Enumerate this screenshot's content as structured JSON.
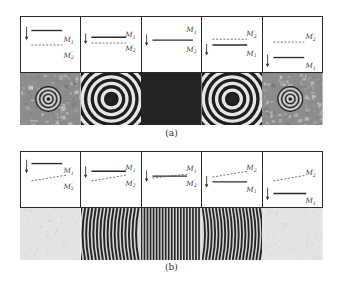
{
  "figure": {
    "panels": [
      {
        "id": "a",
        "caption": "(a)",
        "columns": [
          {
            "mirror_top": "M1",
            "mirror_bottom": "M2'",
            "m1_position": "above",
            "tilt": "none",
            "pattern": "small-concentric-rings-noisy"
          },
          {
            "mirror_top": "M1",
            "mirror_bottom": "M2'",
            "m1_position": "above",
            "tilt": "none",
            "pattern": "large-concentric-rings"
          },
          {
            "mirror_top": "M1",
            "mirror_bottom": "M2'",
            "m1_position": "coincident",
            "tilt": "none",
            "pattern": "uniform-dark"
          },
          {
            "mirror_top": "M2'",
            "mirror_bottom": "M1",
            "m1_position": "below",
            "tilt": "none",
            "pattern": "large-concentric-rings"
          },
          {
            "mirror_top": "M2'",
            "mirror_bottom": "M1",
            "m1_position": "below",
            "tilt": "none",
            "pattern": "small-concentric-rings-noisy"
          }
        ]
      },
      {
        "id": "b",
        "caption": "(b)",
        "columns": [
          {
            "mirror_top": "M1",
            "mirror_bottom": "M2'",
            "m1_position": "above",
            "tilt": "M2' tilted",
            "pattern": "uniform-light"
          },
          {
            "mirror_top": "M1",
            "mirror_bottom": "M2'",
            "m1_position": "above",
            "tilt": "M2' tilted",
            "pattern": "curved-fringes"
          },
          {
            "mirror_top": "M1",
            "mirror_bottom": "M2'",
            "m1_position": "crossing",
            "tilt": "M2' tilted",
            "pattern": "straight-fringes"
          },
          {
            "mirror_top": "M2'",
            "mirror_bottom": "M1",
            "m1_position": "below",
            "tilt": "M2' tilted",
            "pattern": "curved-fringes"
          },
          {
            "mirror_top": "M2'",
            "mirror_bottom": "M1",
            "m1_position": "below",
            "tilt": "M2' tilted",
            "pattern": "uniform-light"
          }
        ]
      }
    ],
    "labels": {
      "m1": "M",
      "m1_sub": "1",
      "m2": "M",
      "m2_sub": "2",
      "m2_prime": "′"
    }
  }
}
